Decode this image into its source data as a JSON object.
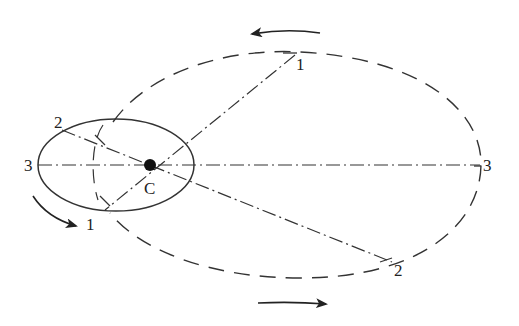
{
  "diagram": {
    "center_label": "C",
    "inner_orbit": {
      "labels": {
        "p1": "1",
        "p2": "2",
        "p3": "3"
      }
    },
    "outer_orbit": {
      "labels": {
        "p1": "1",
        "p2": "2",
        "p3": "3"
      }
    },
    "arrows": {
      "top": "counter-clockwise-arrow",
      "bottom": "clockwise-arrow",
      "left": "clockwise-arrow"
    },
    "colors": {
      "stroke": "#333333",
      "background": "#ffffff"
    }
  }
}
